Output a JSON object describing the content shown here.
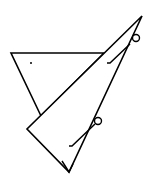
{
  "diagram": {
    "stroke_color": "#000000",
    "background": "#ffffff",
    "shapes": {
      "upright_triangle": {
        "points": "11,53 104,53 41,116"
      },
      "tall_triangle": {
        "points": "142,16 27,129 69,172"
      },
      "inner_edge": {
        "x1": 142,
        "y1": 16,
        "x2": 69,
        "y2": 172
      },
      "bottom_notch": {
        "points": "62,161 69,172 73,164"
      },
      "dot": {
        "cx": 31,
        "cy": 63,
        "r": 1
      },
      "circle_top": {
        "cx": 136,
        "cy": 38,
        "r": 3.5
      },
      "hook_top": {
        "d": "M107,63 L110,63 L130,44"
      },
      "circle_bottom": {
        "cx": 98,
        "cy": 121,
        "r": 3.5
      },
      "hook_bottom": {
        "d": "M69,146 L72,146 L95,124"
      }
    }
  }
}
